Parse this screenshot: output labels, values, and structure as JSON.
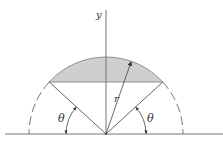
{
  "figure": {
    "labels": {
      "y_axis": "y",
      "radius": "r",
      "angle_left": "θ",
      "angle_right": "θ"
    },
    "colors": {
      "line": "#555555",
      "fill": "#cfcfcf",
      "dashed": "#666666"
    }
  }
}
